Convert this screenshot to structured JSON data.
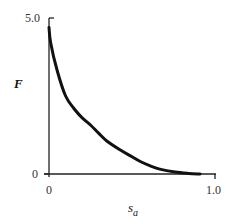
{
  "chart_data": {
    "type": "line",
    "title": "",
    "xlabel": "s_a",
    "xlabel_main": "s",
    "xlabel_sub": "a",
    "ylabel": "F",
    "xlim": [
      0,
      1.0
    ],
    "ylim": [
      0,
      5.0
    ],
    "grid": false,
    "legend": null,
    "x_ticks": [
      "0",
      "1.0"
    ],
    "y_ticks": [
      "0",
      "5.0"
    ],
    "series": [
      {
        "name": "F(s_a)",
        "color": "#111111",
        "x": [
          0.0,
          0.01,
          0.05,
          0.1,
          0.15,
          0.2,
          0.25,
          0.3,
          0.35,
          0.43,
          0.5,
          0.55,
          0.61,
          0.68,
          0.76,
          0.84,
          0.91
        ],
        "y": [
          4.7,
          4.2,
          3.3,
          2.5,
          2.1,
          1.8,
          1.57,
          1.3,
          1.05,
          0.77,
          0.55,
          0.4,
          0.26,
          0.14,
          0.06,
          0.02,
          0.0
        ]
      }
    ]
  }
}
